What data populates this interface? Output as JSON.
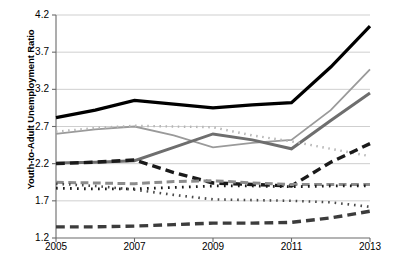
{
  "chart_data": {
    "type": "line",
    "title": "",
    "xlabel": "",
    "ylabel": "Youth-to-Adult Unemployment Ratio",
    "x": [
      2005,
      2006,
      2007,
      2008,
      2009,
      2010,
      2011,
      2012,
      2013
    ],
    "xticks": [
      "2005",
      "2007",
      "2009",
      "2011",
      "2013"
    ],
    "xtick_values": [
      2005,
      2007,
      2009,
      2011,
      2013
    ],
    "yticks": [
      "1.2",
      "1.7",
      "2.2",
      "2.7",
      "3.2",
      "3.7",
      "4.2"
    ],
    "ytick_values": [
      1.2,
      1.7,
      2.2,
      2.7,
      3.2,
      3.7,
      4.2
    ],
    "xlim": [
      2005,
      2013
    ],
    "ylim": [
      1.2,
      4.2
    ],
    "grid": true,
    "grid_axis": "y",
    "legend": "none",
    "series": [
      {
        "name": "series-black-solid",
        "color": "#000000",
        "style": "solid",
        "width": 3.2,
        "values": [
          2.82,
          2.92,
          3.05,
          3.0,
          2.95,
          2.99,
          3.02,
          3.5,
          4.05
        ]
      },
      {
        "name": "series-lightgray-solid",
        "color": "#9a9a9a",
        "style": "solid",
        "width": 1.8,
        "values": [
          2.6,
          2.66,
          2.7,
          2.58,
          2.42,
          2.48,
          2.52,
          2.92,
          3.47
        ]
      },
      {
        "name": "series-darkgray-solid",
        "color": "#6e6e6e",
        "style": "solid",
        "width": 3.0,
        "values": [
          2.21,
          2.22,
          2.24,
          2.42,
          2.6,
          2.52,
          2.4,
          2.78,
          3.15
        ]
      },
      {
        "name": "series-lightgray-dotted",
        "color": "#b5b5b5",
        "style": "dotted",
        "width": 2.4,
        "values": [
          2.63,
          2.68,
          2.71,
          2.7,
          2.69,
          2.58,
          2.5,
          2.4,
          2.3
        ]
      },
      {
        "name": "series-black-dashed",
        "color": "#1a1a1a",
        "style": "dashed",
        "width": 3.4,
        "values": [
          2.2,
          2.22,
          2.25,
          2.08,
          1.94,
          1.92,
          1.9,
          2.22,
          2.47
        ]
      },
      {
        "name": "series-gray-dashed-mid",
        "color": "#8c8c8c",
        "style": "dashed",
        "width": 3.0,
        "values": [
          1.95,
          1.94,
          1.93,
          1.96,
          1.97,
          1.94,
          1.92,
          1.92,
          1.92
        ]
      },
      {
        "name": "series-black-dotted",
        "color": "#1a1a1a",
        "style": "dotted",
        "width": 2.8,
        "values": [
          1.87,
          1.86,
          1.86,
          1.88,
          1.9,
          1.9,
          1.89,
          1.9,
          1.9
        ]
      },
      {
        "name": "series-darkgray-dotted-low",
        "color": "#4a4a4a",
        "style": "dotted",
        "width": 2.6,
        "values": [
          1.93,
          1.9,
          1.85,
          1.78,
          1.72,
          1.71,
          1.7,
          1.68,
          1.62
        ]
      },
      {
        "name": "series-darkgray-dashed-low",
        "color": "#3c3c3c",
        "style": "dashed",
        "width": 3.4,
        "values": [
          1.35,
          1.35,
          1.36,
          1.38,
          1.4,
          1.4,
          1.41,
          1.47,
          1.56
        ]
      }
    ]
  }
}
